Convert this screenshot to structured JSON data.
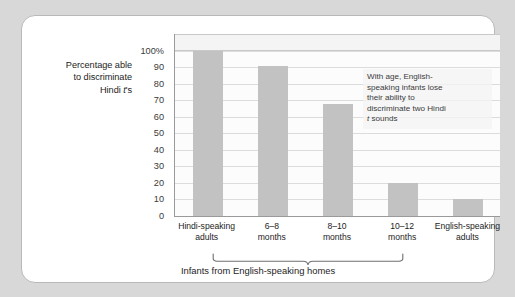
{
  "chart_data": {
    "type": "bar",
    "title": "",
    "subtitle": "",
    "xlabel": "Infants from English-speaking homes",
    "ylabel": "Percentage able to discriminate Hindi t's",
    "ylabel_lines": [
      "Percentage able",
      "to discriminate",
      "Hindi t's"
    ],
    "ylabel_italic_token": "t",
    "categories": [
      "Hindi-speaking\nadults",
      "6–8\nmonths",
      "8–10\nmonths",
      "10–12\nmonths",
      "English-speaking\nadults"
    ],
    "categories_flat": [
      "Hindi-speaking adults",
      "6–8 months",
      "8–10 months",
      "10–12 months",
      "English-speaking adults"
    ],
    "values": [
      100,
      91,
      68,
      20,
      10
    ],
    "ylim": [
      0,
      100
    ],
    "ytick_labels": [
      "100%",
      "90",
      "80",
      "70",
      "60",
      "50",
      "40",
      "30",
      "20",
      "10",
      "0"
    ],
    "ytick_values": [
      100,
      90,
      80,
      70,
      60,
      50,
      40,
      30,
      20,
      10,
      0
    ],
    "grid": true,
    "legend": false,
    "legend_position": "none",
    "bar_color": "#c2c2c2",
    "plot_background": "#fcfcfc",
    "gridline_color": "#dcdcdc",
    "axis_color": "#9a9a9a",
    "annotations": [
      {
        "text": "With age, English-speaking infants lose their ability to discriminate two Hindi t sounds",
        "lines": [
          "With age, English-",
          "speaking infants lose",
          "their ability to",
          "discriminate two Hindi",
          "t sounds"
        ],
        "italic_token": "t"
      }
    ],
    "group_bracket": {
      "label": "Infants from English-speaking homes",
      "covers": [
        "6–8 months",
        "8–10 months",
        "10–12 months"
      ]
    }
  },
  "figure": {
    "card_background": "#ffffff",
    "page_background": "#d8d8d8",
    "border_color": "#b9b9b9"
  }
}
